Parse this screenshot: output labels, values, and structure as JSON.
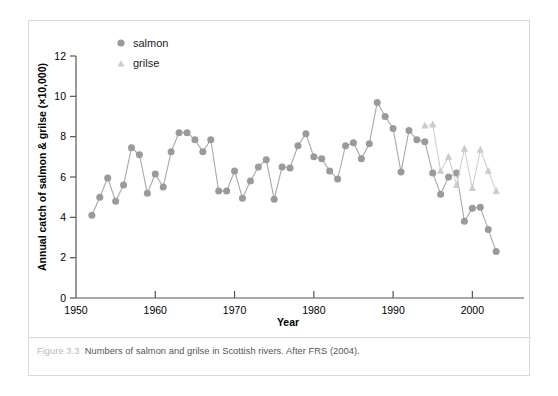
{
  "figure": {
    "caption_number": "Figure 3.3",
    "caption_text": "Numbers of salmon and grilse in Scottish rivers. After FRS (2004)."
  },
  "legend": {
    "salmon_label": "salmon",
    "grilse_label": "grilse"
  },
  "colors": {
    "salmon": "#9a9a9a",
    "grilse": "#cccccc",
    "axis": "#555555",
    "frame": "#d8d8d8",
    "caption_number": "#b8b8b8",
    "caption_text": "#555555"
  },
  "chart_data": {
    "type": "line",
    "title": "",
    "xlabel": "Year",
    "ylabel": "Annual catch of salmon & grilse (×10,000)",
    "xlim": [
      1950,
      2005
    ],
    "ylim": [
      0,
      12
    ],
    "xticks": [
      1950,
      1960,
      1970,
      1980,
      1990,
      2000
    ],
    "yticks": [
      0,
      2,
      4,
      6,
      8,
      10,
      12
    ],
    "xtick_labels": [
      "1950",
      "1960",
      "1970",
      "1980",
      "1990",
      "2000"
    ],
    "ytick_labels": [
      "0",
      "2",
      "4",
      "6",
      "8",
      "10",
      "12"
    ],
    "grid": false,
    "legend_position": "top-left-inside",
    "series": [
      {
        "name": "salmon",
        "marker": "circle",
        "color": "#9a9a9a",
        "x": [
          1952,
          1953,
          1954,
          1955,
          1956,
          1957,
          1958,
          1959,
          1960,
          1961,
          1962,
          1963,
          1964,
          1965,
          1966,
          1967,
          1968,
          1969,
          1970,
          1971,
          1972,
          1973,
          1974,
          1975,
          1976,
          1977,
          1978,
          1979,
          1980,
          1981,
          1982,
          1983,
          1984,
          1985,
          1986,
          1987,
          1988,
          1989,
          1990,
          1991,
          1992,
          1993,
          1994,
          1995,
          1996,
          1997,
          1998,
          1999,
          2000,
          2001,
          2002,
          2003
        ],
        "values": [
          4.1,
          5.0,
          5.95,
          4.8,
          5.6,
          7.45,
          7.1,
          5.2,
          6.15,
          5.5,
          7.25,
          8.2,
          8.2,
          7.85,
          7.25,
          7.85,
          5.3,
          5.3,
          6.3,
          4.95,
          5.8,
          6.5,
          6.85,
          4.9,
          6.5,
          6.45,
          7.55,
          8.15,
          7.0,
          6.9,
          6.3,
          5.9,
          7.55,
          7.7,
          6.9,
          7.65,
          9.7,
          9.0,
          8.4,
          6.25,
          8.3,
          7.85,
          7.75,
          6.2,
          5.15,
          6.0,
          6.2,
          3.8,
          4.45,
          4.5,
          3.4,
          2.3
        ]
      },
      {
        "name": "grilse",
        "marker": "triangle",
        "color": "#cccccc",
        "x": [
          1994,
          1995,
          1996,
          1997,
          1998,
          1999,
          2000,
          2001,
          2002,
          2003
        ],
        "values": [
          8.55,
          8.6,
          6.3,
          7.0,
          5.6,
          7.4,
          5.45,
          7.35,
          6.3,
          5.3
        ]
      }
    ]
  }
}
